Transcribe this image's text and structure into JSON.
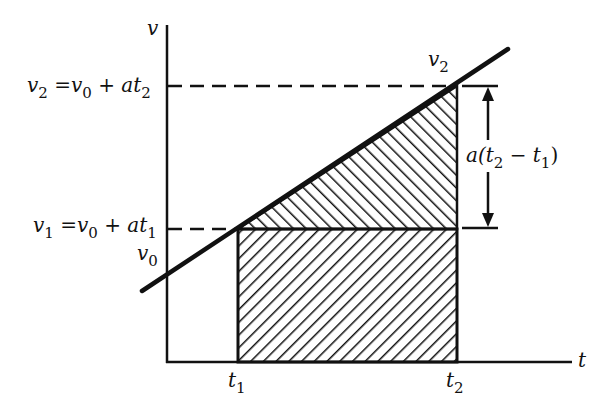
{
  "diagram": {
    "axes": {
      "y_label": "v",
      "x_label": "t"
    },
    "labels": {
      "v2_eq": {
        "lhs": "v",
        "lhs_sub": "2",
        "eq": " =",
        "rhs_v": "v",
        "rhs_v_sub": "0",
        "plus": " + ",
        "at": "at",
        "at_sub": "2"
      },
      "v1_eq": {
        "lhs": "v",
        "lhs_sub": "1",
        "eq": " =",
        "rhs_v": "v",
        "rhs_v_sub": "0",
        "plus": " + ",
        "at": "at",
        "at_sub": "1"
      },
      "v0": {
        "v": "v",
        "sub": "0"
      },
      "v2_point": {
        "v": "v",
        "sub": "2"
      },
      "t1": {
        "t": "t",
        "sub": "1"
      },
      "t2": {
        "t": "t",
        "sub": "2"
      },
      "delta": {
        "pre": "a(t",
        "sub1": "2",
        "mid": " − t",
        "sub2": "1",
        "post": ")"
      }
    },
    "regions": [
      {
        "name": "rectangle",
        "description": "v1 (t2 - t1) area, hatched"
      },
      {
        "name": "triangle",
        "description": "1/2 a (t2 - t1)^2 area, hatched"
      }
    ],
    "colors": {
      "ink": "#111111",
      "background": "#ffffff"
    }
  }
}
